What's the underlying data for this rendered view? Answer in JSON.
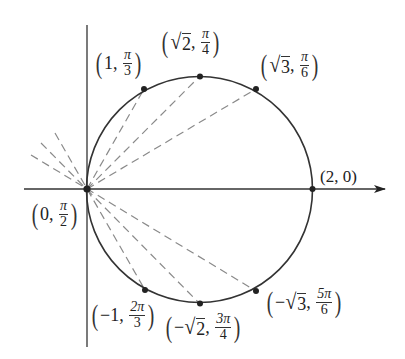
{
  "figure": {
    "colors": {
      "curve": "#333333",
      "axis": "#333333",
      "dashed": "#8a8a8a",
      "point": "#222222"
    }
  },
  "points": [
    {
      "id": "p0",
      "r": "0",
      "r_sign": "",
      "r_sqrt": false,
      "theta_num": "π",
      "theta_den": "2",
      "label": "(0, π/2)"
    },
    {
      "id": "p1",
      "r": "1",
      "r_sign": "",
      "r_sqrt": false,
      "theta_num": "π",
      "theta_den": "3",
      "label": "(1, π/3)"
    },
    {
      "id": "p2",
      "r": "2",
      "r_sign": "",
      "r_sqrt": true,
      "theta_num": "π",
      "theta_den": "4",
      "label": "(√2, π/4)"
    },
    {
      "id": "p3",
      "r": "3",
      "r_sign": "",
      "r_sqrt": true,
      "theta_num": "π",
      "theta_den": "6",
      "label": "(√3, π/6)"
    },
    {
      "id": "p4",
      "r": "2",
      "r_sign": "",
      "r_sqrt": false,
      "theta": "0",
      "label": "(2, 0)"
    },
    {
      "id": "p5",
      "r": "1",
      "r_sign": "−",
      "r_sqrt": false,
      "theta_num": "2π",
      "theta_den": "3",
      "label": "(−1, 2π/3)"
    },
    {
      "id": "p6",
      "r": "2",
      "r_sign": "−",
      "r_sqrt": true,
      "theta_num": "3π",
      "theta_den": "4",
      "label": "(−√2, 3π/4)"
    },
    {
      "id": "p7",
      "r": "3",
      "r_sign": "−",
      "r_sqrt": true,
      "theta_num": "5π",
      "theta_den": "6",
      "label": "(−√3, 5π/6)"
    }
  ],
  "text": {
    "lparen": "(",
    "rparen": ")",
    "comma": ",",
    "sqrt": "√",
    "p0": {
      "r": "0",
      "num": "π",
      "den": "2"
    },
    "p1": {
      "r": "1",
      "num": "π",
      "den": "3"
    },
    "p2": {
      "r": "2",
      "num": "π",
      "den": "4"
    },
    "p3": {
      "r": "3",
      "num": "π",
      "den": "6"
    },
    "p4": {
      "full": "(2, 0)"
    },
    "p5": {
      "sign": "−",
      "r": "1",
      "num": "2π",
      "den": "3"
    },
    "p6": {
      "sign": "−",
      "r": "2",
      "num": "3π",
      "den": "4"
    },
    "p7": {
      "sign": "−",
      "r": "3",
      "num": "5π",
      "den": "6"
    }
  }
}
